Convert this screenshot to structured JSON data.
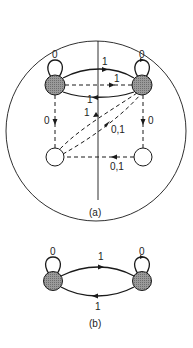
{
  "colors": {
    "stroke": "#1a1a1a",
    "shaded_fill": "#8a8a8a",
    "open_fill": "#ffffff",
    "background": "#ffffff"
  },
  "figure_a": {
    "caption": "(a)",
    "nodes": [
      {
        "id": "TL",
        "type": "shaded"
      },
      {
        "id": "TR",
        "type": "shaded"
      },
      {
        "id": "BL",
        "type": "open"
      },
      {
        "id": "BR",
        "type": "open"
      }
    ],
    "labels": {
      "loop_tl": "0",
      "loop_tr": "0",
      "solid_top_tl_tr": "1",
      "dashed_tl_tr": "1",
      "solid_bottom_tr_tl": "1",
      "dashed_tr_bl": "1",
      "dashed_bl_tr": "0,1",
      "dashed_tl_bl": "0",
      "dashed_tr_br": "0",
      "dashed_br_bl": "0,1"
    }
  },
  "figure_b": {
    "caption": "(b)",
    "nodes": [
      {
        "id": "L",
        "type": "shaded"
      },
      {
        "id": "R",
        "type": "shaded"
      }
    ],
    "labels": {
      "loop_l": "0",
      "loop_r": "0",
      "top_l_r": "1",
      "bottom_r_l": "1"
    }
  }
}
